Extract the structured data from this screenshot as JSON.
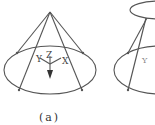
{
  "figure": {
    "caption": "(a)",
    "axes": {
      "x": "X",
      "y": "Y",
      "z": "Z"
    },
    "colors": {
      "stroke": "#555555",
      "background": "#ffffff"
    },
    "panel_a": {
      "shape": "cone",
      "apex": [
        50,
        12
      ],
      "base_ellipse": {
        "cx": 50,
        "cy": 70,
        "rx": 46,
        "ry": 24
      },
      "ribs": [
        [
          17,
          53
        ],
        [
          83,
          53
        ],
        [
          19,
          90
        ],
        [
          82,
          90
        ]
      ]
    },
    "panel_b": {
      "shape": "truncated-cone (partially visible)",
      "top_ellipse": {
        "cx": 160,
        "cy": 10,
        "rx": 30,
        "ry": 9
      },
      "base_ellipse": {
        "cx": 160,
        "cy": 70,
        "rx": 46,
        "ry": 24
      }
    }
  }
}
